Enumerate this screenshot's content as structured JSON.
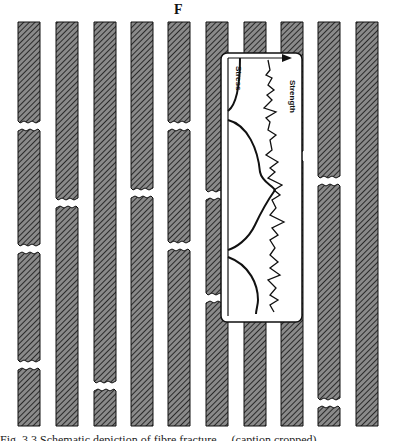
{
  "figure": {
    "force_label": "F",
    "caption": "Fig. 3.3  Schematic depiction of fibre fracture ... (caption cropped)",
    "colors": {
      "fibre_fill": "#6e6e6e",
      "fibre_hatch": "#2a2a2a",
      "outline": "#111111",
      "background": "#ffffff"
    },
    "fibres": [
      {
        "x": 18,
        "breaks": [
          126,
          249,
          365
        ]
      },
      {
        "x": 56,
        "breaks": [
          203
        ]
      },
      {
        "x": 94,
        "breaks": [
          386
        ]
      },
      {
        "x": 131,
        "breaks": [
          193
        ]
      },
      {
        "x": 168,
        "breaks": [
          126,
          246
        ]
      },
      {
        "x": 206,
        "breaks": [
          195,
          298
        ]
      },
      {
        "x": 244,
        "breaks": []
      },
      {
        "x": 281,
        "breaks": [
          156
        ]
      },
      {
        "x": 318,
        "breaks": [
          181,
          403
        ]
      },
      {
        "x": 356,
        "breaks": []
      }
    ],
    "fibre_top": 22,
    "fibre_bottom": 426,
    "fibre_width": 22,
    "inset": {
      "stress_label": "Stress",
      "strength_label": "Strength",
      "box": {
        "x": 221,
        "y": 53,
        "w": 81,
        "h": 269
      }
    }
  }
}
